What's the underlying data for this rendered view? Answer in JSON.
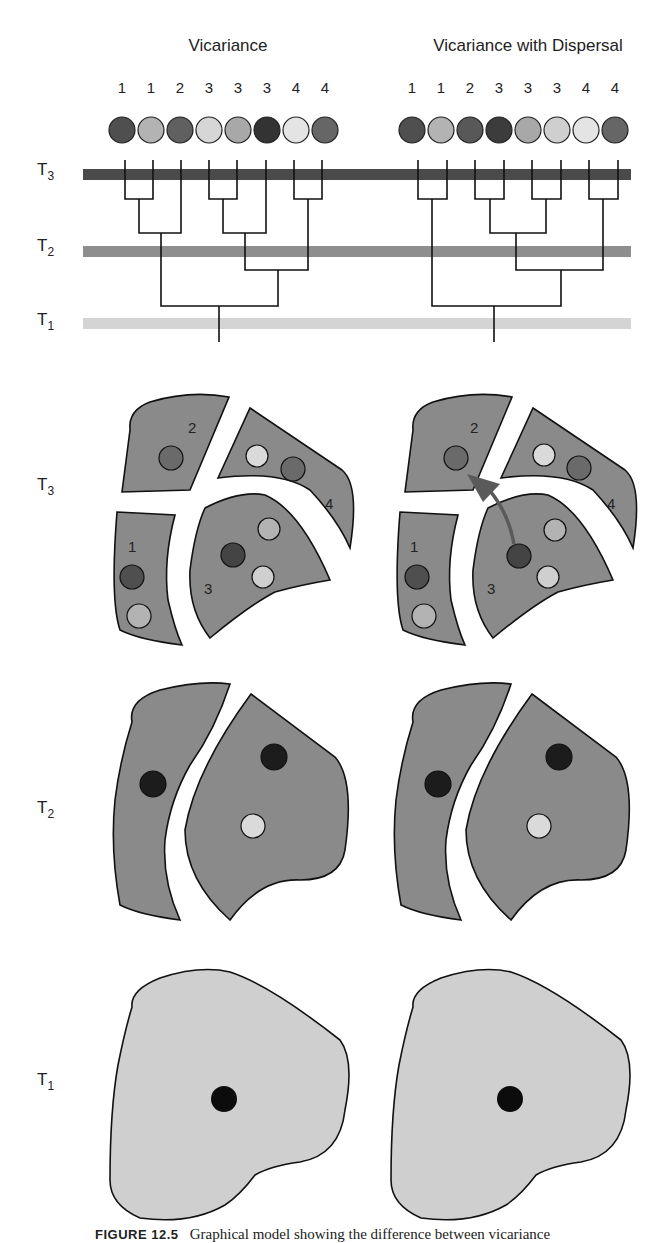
{
  "columns": {
    "left": {
      "title": "Vicariance"
    },
    "right": {
      "title": "Vicariance with Dispersal"
    }
  },
  "time_labels": {
    "T3": {
      "main": "T",
      "sub": "3"
    },
    "T2": {
      "main": "T",
      "sub": "2"
    },
    "T1": {
      "main": "T",
      "sub": "1"
    }
  },
  "tree_left": {
    "tip_labels": [
      "1",
      "1",
      "2",
      "3",
      "3",
      "3",
      "4",
      "4"
    ],
    "tip_shades": [
      "dark",
      "light",
      "medium-dark",
      "pale",
      "light",
      "darkest",
      "pale",
      "medium-dark"
    ]
  },
  "tree_right": {
    "tip_labels": [
      "1",
      "1",
      "2",
      "3",
      "3",
      "3",
      "4",
      "4"
    ],
    "tip_shades": [
      "dark",
      "light",
      "medium-dark",
      "darkest",
      "light",
      "pale",
      "pale",
      "medium-dark"
    ]
  },
  "time_bars": {
    "T3": {
      "color": "#4a4a4a"
    },
    "T2": {
      "color": "#8e8e8e"
    },
    "T1": {
      "color": "#d4d4d4"
    }
  },
  "map_T3": {
    "region_labels": [
      "1",
      "2",
      "3",
      "4"
    ],
    "dispersal_arrow": "from region 3 to region 2 (right panel only)"
  },
  "caption": {
    "figure_label": "FIGURE 12.5",
    "text": "Graphical model showing the difference between vicariance"
  },
  "colors": {
    "dark": "#4f4f4f",
    "darkest": "#2e2e2e",
    "medium-dark": "#6a6a6a",
    "light": "#b3b3b3",
    "pale": "#dadada",
    "region_fill_dark": "#8a8a8a",
    "region_fill_light": "#cfcfcf",
    "black": "#0c0c0c",
    "arrow": "#5a5a5a"
  }
}
